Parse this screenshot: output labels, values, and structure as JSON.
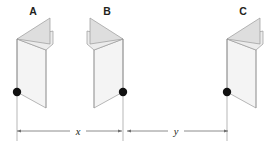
{
  "figure": {
    "background_color": "#ffffff",
    "width": 269,
    "height": 143,
    "stroke_color": "#8d8d8d",
    "dim_line_color": "#6f6f6f",
    "pivot_color": "#111111",
    "face_fill_light": "#f2f2f2",
    "face_fill_mid": "#e8e8e8",
    "face_fill_dark": "#dcdcdc",
    "objects": [
      {
        "id": "a",
        "label": "A",
        "label_x": 33,
        "label_y": 14,
        "pivot_x": 17,
        "pivot_y": 92,
        "spine_side": "left"
      },
      {
        "id": "b",
        "label": "B",
        "label_x": 104,
        "label_y": 14,
        "pivot_x": 123,
        "pivot_y": 92,
        "spine_side": "right"
      },
      {
        "id": "c",
        "label": "C",
        "label_x": 243,
        "label_y": 14,
        "pivot_x": 227,
        "pivot_y": 92,
        "spine_side": "left"
      }
    ],
    "dimensions": [
      {
        "id": "x",
        "label": "x",
        "label_x": 78,
        "label_y": 134,
        "start_x": 17,
        "end_x": 122,
        "line_y": 131
      },
      {
        "id": "y",
        "label": "y",
        "label_x": 176,
        "label_y": 134,
        "start_x": 127,
        "end_x": 228,
        "line_y": 131
      }
    ],
    "extension_lines": [
      {
        "id": "ext-a",
        "x": 17,
        "y_top": 92,
        "y_bottom": 141
      },
      {
        "id": "ext-b",
        "x": 123,
        "y_top": 92,
        "y_bottom": 141
      },
      {
        "id": "ext-c",
        "x": 227,
        "y_top": 92,
        "y_bottom": 141
      }
    ]
  }
}
